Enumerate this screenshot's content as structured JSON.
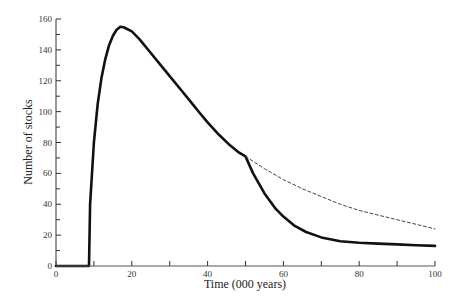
{
  "chart_data": {
    "type": "line",
    "title": "",
    "xlabel": "Time (000 years)",
    "ylabel": "Number of stocks",
    "xlim": [
      0,
      100
    ],
    "ylim": [
      0,
      160
    ],
    "x_ticks": [
      0,
      20,
      40,
      60,
      80,
      100
    ],
    "x_minor_ticks": [
      10,
      30,
      50,
      70,
      90
    ],
    "y_ticks": [
      0,
      20,
      40,
      60,
      80,
      100,
      120,
      140,
      160
    ],
    "y_minor_ticks": [
      10,
      30,
      50,
      70,
      90,
      110,
      130,
      150
    ],
    "grid": false,
    "legend": null,
    "series": [
      {
        "name": "solid",
        "style": "solid",
        "color": "#111111",
        "x": [
          0,
          8.7,
          9,
          10,
          11,
          12,
          13,
          14,
          15,
          16,
          17,
          18,
          20,
          22,
          25,
          28,
          30,
          33,
          36,
          38,
          40,
          43,
          46,
          48,
          50,
          52,
          55,
          58,
          60,
          63,
          66,
          70,
          75,
          80,
          85,
          90,
          95,
          100
        ],
        "y": [
          0,
          0,
          40,
          80,
          105,
          122,
          134,
          143,
          149,
          153,
          155,
          154.5,
          152,
          147,
          138,
          129,
          123,
          114,
          105,
          99,
          93,
          85,
          78,
          74,
          71,
          60,
          47,
          37,
          32,
          26,
          22,
          18.5,
          16,
          15,
          14.5,
          14,
          13.5,
          13
        ]
      },
      {
        "name": "dashed",
        "style": "dashed",
        "color": "#444444",
        "x": [
          50,
          55,
          60,
          65,
          70,
          75,
          80,
          85,
          90,
          95,
          100
        ],
        "y": [
          71,
          63,
          56,
          50,
          45,
          40,
          36,
          33,
          30,
          27,
          24
        ]
      }
    ]
  }
}
